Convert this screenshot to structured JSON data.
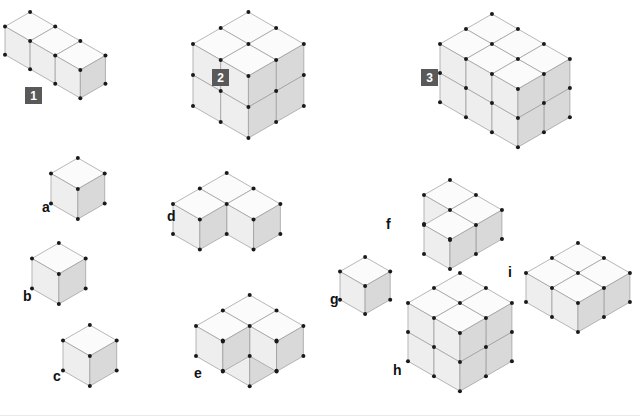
{
  "page": {
    "background_color": "#ffffff",
    "width": 640,
    "height": 416
  },
  "style": {
    "cube_size": 30,
    "top_face_color": "#fbfbfb",
    "left_face_color": "#eeeeee",
    "right_face_color": "#d9d9d9",
    "edge_color": "#9a9a9a",
    "outline_color": "#7a7a7a",
    "vertex_color": "#1a1a1a",
    "vertex_radius": 2,
    "badge_bg_color": "#595959",
    "badge_text_color": "#ffffff",
    "label_text_color": "#111111"
  },
  "figures": [
    {
      "id": "figure-1",
      "label": "1",
      "label_type": "badge",
      "label_x": 25,
      "label_y": 87,
      "origin_x": 30,
      "origin_y": 12,
      "cube_size": 29,
      "voxels": [
        [
          0,
          0,
          0
        ],
        [
          1,
          0,
          0
        ],
        [
          2,
          0,
          0
        ]
      ]
    },
    {
      "id": "figure-2",
      "label": "2",
      "label_type": "badge",
      "label_x": 212,
      "label_y": 69,
      "origin_x": 248,
      "origin_y": 12,
      "cube_size": 32,
      "voxels": [
        [
          0,
          0,
          0
        ],
        [
          1,
          0,
          0
        ],
        [
          0,
          1,
          0
        ],
        [
          1,
          1,
          0
        ],
        [
          0,
          0,
          1
        ],
        [
          1,
          0,
          1
        ],
        [
          0,
          1,
          1
        ],
        [
          1,
          1,
          1
        ]
      ]
    },
    {
      "id": "figure-3",
      "label": "3",
      "label_type": "badge",
      "label_x": 421,
      "label_y": 69,
      "origin_x": 492,
      "origin_y": 14,
      "cube_size": 30,
      "voxels": [
        [
          0,
          0,
          0
        ],
        [
          1,
          0,
          0
        ],
        [
          2,
          0,
          0
        ],
        [
          0,
          1,
          0
        ],
        [
          1,
          1,
          0
        ],
        [
          2,
          1,
          0
        ],
        [
          0,
          0,
          1
        ],
        [
          1,
          0,
          1
        ],
        [
          2,
          0,
          1
        ],
        [
          0,
          1,
          1
        ],
        [
          1,
          1,
          1
        ],
        [
          2,
          1,
          1
        ]
      ]
    },
    {
      "id": "figure-a",
      "label": "a",
      "label_type": "letter",
      "label_x": 42,
      "label_y": 200,
      "origin_x": 78,
      "origin_y": 158,
      "cube_size": 31,
      "voxels": [
        [
          0,
          0,
          0
        ]
      ]
    },
    {
      "id": "figure-b",
      "label": "b",
      "label_type": "letter",
      "label_x": 23,
      "label_y": 289,
      "origin_x": 59,
      "origin_y": 243,
      "cube_size": 31,
      "voxels": [
        [
          0,
          0,
          0
        ]
      ]
    },
    {
      "id": "figure-c",
      "label": "c",
      "label_type": "letter",
      "label_x": 53,
      "label_y": 369,
      "origin_x": 90,
      "origin_y": 325,
      "cube_size": 31,
      "voxels": [
        [
          0,
          0,
          0
        ]
      ]
    },
    {
      "id": "figure-d",
      "label": "d",
      "label_type": "letter",
      "label_x": 167,
      "label_y": 209,
      "origin_x": 227,
      "origin_y": 173,
      "cube_size": 31,
      "voxels": [
        [
          0,
          0,
          0
        ],
        [
          1,
          0,
          0
        ],
        [
          0,
          1,
          0
        ]
      ]
    },
    {
      "id": "figure-e",
      "label": "e",
      "label_type": "letter",
      "label_x": 194,
      "label_y": 366,
      "origin_x": 250,
      "origin_y": 295,
      "cube_size": 31,
      "voxels": [
        [
          0,
          0,
          1
        ],
        [
          1,
          0,
          1
        ],
        [
          0,
          1,
          1
        ],
        [
          0,
          0,
          0
        ]
      ]
    },
    {
      "id": "figure-f",
      "label": "f",
      "label_type": "letter",
      "label_x": 386,
      "label_y": 217,
      "origin_x": 450,
      "origin_y": 180,
      "cube_size": 30,
      "voxels": [
        [
          0,
          0,
          0
        ],
        [
          1,
          0,
          0
        ],
        [
          1,
          1,
          0
        ]
      ]
    },
    {
      "id": "figure-g",
      "label": "g",
      "label_type": "letter",
      "label_x": 330,
      "label_y": 292,
      "origin_x": 365,
      "origin_y": 257,
      "cube_size": 29,
      "voxels": [
        [
          0,
          0,
          0
        ]
      ]
    },
    {
      "id": "figure-h",
      "label": "h",
      "label_type": "letter",
      "label_x": 393,
      "label_y": 363,
      "origin_x": 460,
      "origin_y": 273,
      "cube_size": 30,
      "voxels": [
        [
          0,
          0,
          0
        ],
        [
          1,
          0,
          0
        ],
        [
          0,
          1,
          0
        ],
        [
          1,
          1,
          0
        ],
        [
          0,
          0,
          1
        ],
        [
          1,
          0,
          1
        ],
        [
          0,
          1,
          1
        ],
        [
          1,
          1,
          1
        ]
      ]
    },
    {
      "id": "figure-i",
      "label": "i",
      "label_type": "letter",
      "label_x": 508,
      "label_y": 265,
      "origin_x": 578,
      "origin_y": 243,
      "cube_size": 30,
      "voxels": [
        [
          0,
          0,
          0
        ],
        [
          1,
          0,
          0
        ],
        [
          0,
          1,
          0
        ],
        [
          1,
          1,
          0
        ]
      ]
    }
  ]
}
